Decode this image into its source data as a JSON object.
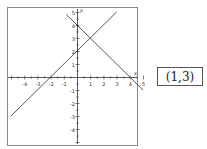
{
  "chart_data": {
    "type": "line",
    "title": "",
    "xlabel": "x",
    "ylabel": "y",
    "xlim": [
      -5.3,
      4.6
    ],
    "ylim": [
      -5.1,
      5.3
    ],
    "grid": false,
    "x_ticks": [
      -4,
      -3,
      -2,
      -1,
      1,
      2,
      3,
      4,
      5
    ],
    "y_ticks": [
      -4,
      -3,
      -2,
      -1,
      1,
      2,
      3,
      4,
      5
    ],
    "series": [
      {
        "name": "y = x + 2",
        "slope": 1,
        "intercept": 2,
        "x": [
          -5,
          3
        ],
        "y": [
          -3,
          5
        ]
      },
      {
        "name": "y = -x + 4",
        "slope": -1,
        "intercept": 4,
        "x": [
          -0.8,
          5
        ],
        "y": [
          4.8,
          -1
        ]
      }
    ],
    "intersection": {
      "x": 1,
      "y": 3
    },
    "colors": {
      "axis": "#333333",
      "line": "#444444",
      "frame": "#888888"
    }
  },
  "answer": {
    "label": "(1,3)"
  },
  "corner_mark": "."
}
